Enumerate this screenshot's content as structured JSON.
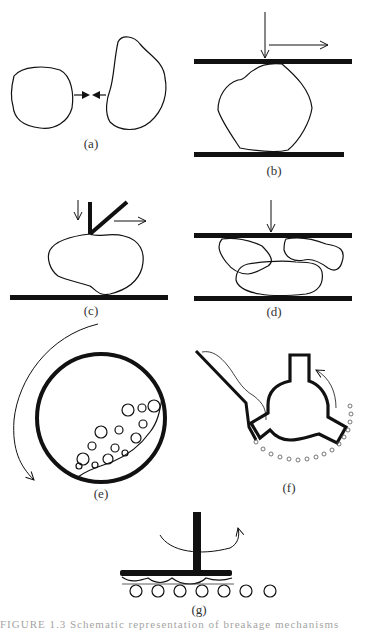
{
  "figure": {
    "panels": [
      {
        "id": "a",
        "label": "(a)",
        "description": "Two particles colliding (impact between particles)"
      },
      {
        "id": "b",
        "label": "(b)",
        "description": "Particle compressed between two plates with shear"
      },
      {
        "id": "c",
        "label": "(c)",
        "description": "Particle on plate loaded by a blade with compression and shear"
      },
      {
        "id": "d",
        "label": "(d)",
        "description": "Bed of particles compressed between two plates"
      },
      {
        "id": "e",
        "label": "(e)",
        "description": "Rotating drum / tumbling ball mill with grinding media"
      },
      {
        "id": "f",
        "label": "(f)",
        "description": "Rotor with blades beneath a feed chute, particles discharged"
      },
      {
        "id": "g",
        "label": "(g)",
        "description": "Rotating disc over a bed of spheres (attrition / rolling)"
      }
    ]
  },
  "caption": {
    "text": "FIGURE 1.3   Schematic representation of breakage mechanisms"
  },
  "colors": {
    "ink": "#111111",
    "background": "#ffffff",
    "label": "#333333"
  }
}
